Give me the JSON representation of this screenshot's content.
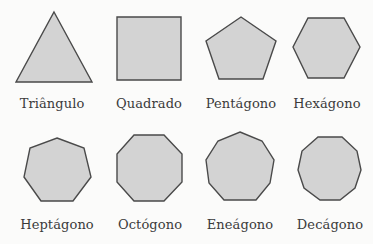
{
  "figure": {
    "background": "#fbfbfa",
    "fill_color": "#d3d3d3",
    "stroke_color": "#4a4a4a",
    "text_color": "#3a3a3a",
    "shapes": [
      {
        "id": "triangle",
        "label": "Triângulo",
        "sides": 3
      },
      {
        "id": "square",
        "label": "Quadrado",
        "sides": 4
      },
      {
        "id": "pentagon",
        "label": "Pentágono",
        "sides": 5
      },
      {
        "id": "hexagon",
        "label": "Hexágono",
        "sides": 6
      },
      {
        "id": "heptagon",
        "label": "Heptágono",
        "sides": 7
      },
      {
        "id": "octagon",
        "label": "Octógono",
        "sides": 8
      },
      {
        "id": "nonagon",
        "label": "Eneágono",
        "sides": 9
      },
      {
        "id": "decagon",
        "label": "Decágono",
        "sides": 10
      }
    ]
  }
}
